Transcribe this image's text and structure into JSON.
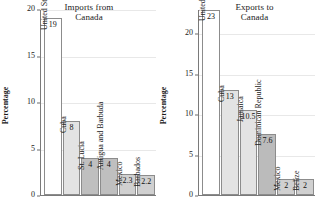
{
  "chart_data": [
    {
      "type": "bar",
      "title": "Imports from Canada",
      "title_line1": "Imports from",
      "title_line2": "Canada",
      "xlabel": "",
      "ylabel": "Percentage",
      "ylim": [
        0,
        20
      ],
      "yticks": [
        0,
        5,
        10,
        15,
        20
      ],
      "ytick_labels": [
        "0",
        "5",
        "10",
        "15",
        "20"
      ],
      "grid": true,
      "legend": "none",
      "categories": [
        "United States",
        "Cuba",
        "St. Lucia",
        "Antigua and Barbuda",
        "Mexico",
        "Barbados"
      ],
      "values": [
        19,
        8,
        4,
        4,
        2.3,
        2.2
      ],
      "value_labels": [
        "19",
        "8",
        "4",
        "4",
        "2.3",
        "2.2"
      ],
      "bar_colors": [
        "#ffffff",
        "#e3e3e3",
        "#bfbfbf",
        "#bfbfbf",
        "#d0d0d0",
        "#d0d0d0"
      ]
    },
    {
      "type": "bar",
      "title": "Exports to Canada",
      "title_line1": "Exports to",
      "title_line2": "Canada",
      "xlabel": "",
      "ylabel": "Percentage",
      "ylim": [
        0,
        23
      ],
      "yticks": [
        0,
        5,
        10,
        15,
        20
      ],
      "ytick_labels": [
        "0",
        "5",
        "10",
        "15",
        "20"
      ],
      "grid": true,
      "legend": "none",
      "categories": [
        "United States",
        "Cuba",
        "Jamaica",
        "Dominican Republic",
        "Mexico",
        "Belize"
      ],
      "values": [
        23,
        13,
        10.5,
        7.6,
        2,
        2
      ],
      "value_labels": [
        "23",
        "13",
        "10.5",
        "7.6",
        "2",
        "2"
      ],
      "bar_colors": [
        "#ffffff",
        "#e3e3e3",
        "#e3e3e3",
        "#bbbbbb",
        "#d0d0d0",
        "#d0d0d0"
      ]
    }
  ]
}
